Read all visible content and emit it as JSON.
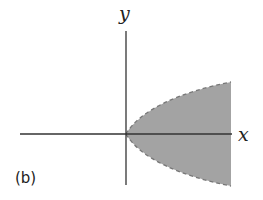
{
  "figure": {
    "label": "(b)",
    "x_axis_label": "x",
    "y_axis_label": "y",
    "region_description": "Shaded region inside parabola x = y^2, bounded by dashed curve (boundary not included), x > 0",
    "colors": {
      "fill": "#a3a3a3",
      "axis": "#333333",
      "boundary": "#777777"
    }
  }
}
